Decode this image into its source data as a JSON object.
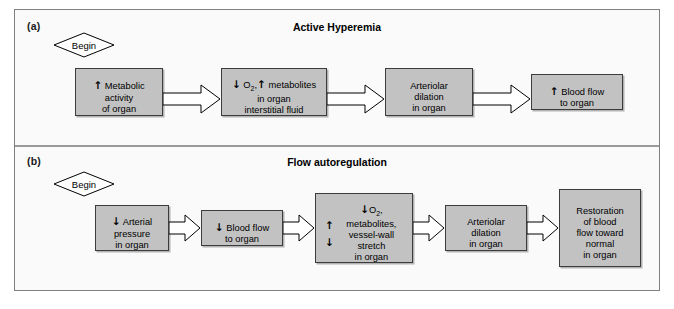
{
  "figure": {
    "panels": [
      {
        "id": "a",
        "label": "(a)",
        "title": "Active Hyperemia",
        "begin_label": "Begin",
        "steps": [
          {
            "name": "metabolic-activity",
            "lines": "Metabolic\nactivity\nof organ",
            "lead_arrow": "↑"
          },
          {
            "name": "o2-metabolites",
            "lines": "metabolites\nin organ\ninterstitial fluid",
            "lead_arrow": "↓ O2, ↑"
          },
          {
            "name": "arteriolar-dilation",
            "lines": "Arteriolar\ndilation\nin organ",
            "lead_arrow": ""
          },
          {
            "name": "blood-flow",
            "lines": "Blood flow\nto organ",
            "lead_arrow": "↑"
          }
        ]
      },
      {
        "id": "b",
        "label": "(b)",
        "title": "Flow autoregulation",
        "begin_label": "Begin",
        "steps": [
          {
            "name": "arterial-pressure",
            "lines": "Arterial\npressure\nin organ",
            "lead_arrow": "↓"
          },
          {
            "name": "blood-flow-to-organ",
            "lines": "Blood flow\nto organ",
            "lead_arrow": "↓"
          },
          {
            "name": "o2-metabolites-stretch",
            "lines": "metabolites,\nvessel-wall\nstretch\nin organ",
            "lead_arrow": "↓ O2,",
            "side_arrows": [
              "↑",
              "↓"
            ]
          },
          {
            "name": "arteriolar-dilation",
            "lines": "Arteriolar\ndilation\nin organ",
            "lead_arrow": ""
          },
          {
            "name": "restoration",
            "lines": "Restoration\nof blood\nflow toward\nnormal\nin organ",
            "lead_arrow": ""
          }
        ]
      }
    ],
    "colors": {
      "box_fill": "#c2c2c2",
      "box_border": "#3c3c3c",
      "panel_bg": "#fafafa",
      "frame_border": "#808080",
      "arrow_fill": "#ffffff",
      "arrow_stroke": "#000000",
      "text": "#000000"
    }
  }
}
